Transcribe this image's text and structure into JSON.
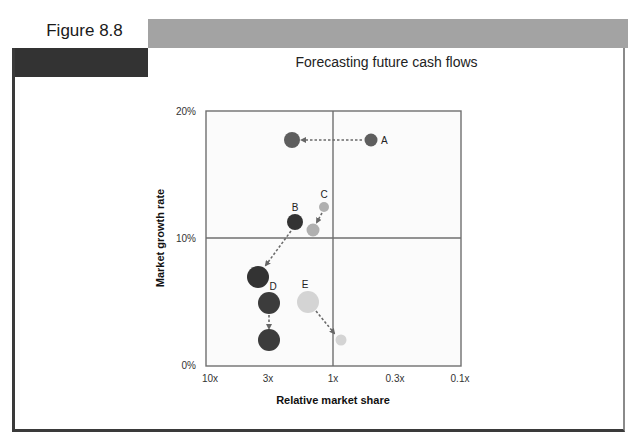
{
  "figure": {
    "label": "Figure 8.8",
    "title": "Forecasting future cash flows",
    "colors": {
      "top_bar": "#a3a3a3",
      "dark_block": "#333333",
      "frame": "#3a3a3a"
    }
  },
  "chart_data": {
    "type": "scatter",
    "subtype": "bubble (BCG growth-share matrix with movement arrows)",
    "title": "Forecasting future cash flows",
    "xlabel": "Relative market share",
    "ylabel": "Market growth rate",
    "x_ticks": [
      "10x",
      "3x",
      "1x",
      "0.3x",
      "0.1x"
    ],
    "x_scale": "log, reversed (10x on left, 0.1x on right)",
    "y_ticks": [
      "0%",
      "10%",
      "20%"
    ],
    "ylim": [
      0,
      20
    ],
    "xlim": [
      "10x",
      "0.1x"
    ],
    "quadrant_dividers": {
      "x": "1x",
      "y": "10%"
    },
    "grid": false,
    "legend": null,
    "series": [
      {
        "name": "A",
        "color": "#5e5e5e",
        "from": {
          "x": 0.5,
          "y": 17.8,
          "size": "small"
        },
        "to": {
          "x": 4.0,
          "y": 17.8,
          "size": "medium"
        }
      },
      {
        "name": "B",
        "color": "#333333",
        "from": {
          "x": 3.6,
          "y": 11.3,
          "size": "medium"
        },
        "to": {
          "x": 5.5,
          "y": 7.0,
          "size": "large"
        }
      },
      {
        "name": "C",
        "color": "#b0b0b0",
        "from": {
          "x": 1.2,
          "y": 12.5,
          "size": "small"
        },
        "to": {
          "x": 1.5,
          "y": 10.7,
          "size": "medium"
        }
      },
      {
        "name": "D",
        "color": "#3c3c3c",
        "from": {
          "x": 3.0,
          "y": 4.9,
          "size": "large"
        },
        "to": {
          "x": 3.0,
          "y": 2.1,
          "size": "large"
        }
      },
      {
        "name": "E",
        "color": "#d4d4d4",
        "from": {
          "x": 1.6,
          "y": 5.0,
          "size": "large"
        },
        "to": {
          "x": 0.85,
          "y": 2.1,
          "size": "small"
        }
      }
    ]
  },
  "plot": {
    "frame": {
      "left": 206,
      "top": 111,
      "right": 461,
      "bottom": 366
    },
    "divider_x": 333,
    "divider_y": 238,
    "bubbles": [
      {
        "id": "A-from",
        "cx": 371,
        "cy": 140,
        "r": 6.5,
        "color": "#5e5e5e"
      },
      {
        "id": "A-to",
        "cx": 292,
        "cy": 140,
        "r": 8,
        "color": "#5e5e5e"
      },
      {
        "id": "B-from",
        "cx": 295,
        "cy": 222,
        "r": 8,
        "color": "#333333"
      },
      {
        "id": "B-to",
        "cx": 258,
        "cy": 277,
        "r": 11,
        "color": "#333333"
      },
      {
        "id": "C-from",
        "cx": 324,
        "cy": 207,
        "r": 5,
        "color": "#b0b0b0"
      },
      {
        "id": "C-to",
        "cx": 313,
        "cy": 230,
        "r": 6.5,
        "color": "#b0b0b0"
      },
      {
        "id": "D-from",
        "cx": 269,
        "cy": 303,
        "r": 11,
        "color": "#3c3c3c"
      },
      {
        "id": "D-to",
        "cx": 269,
        "cy": 340,
        "r": 11,
        "color": "#3c3c3c"
      },
      {
        "id": "E-from",
        "cx": 308,
        "cy": 302,
        "r": 11,
        "color": "#d4d4d4"
      },
      {
        "id": "E-to",
        "cx": 341,
        "cy": 340,
        "r": 5.5,
        "color": "#d4d4d4"
      }
    ],
    "labels": [
      {
        "text": "A",
        "x": 381,
        "y": 144
      },
      {
        "text": "B",
        "x": 295,
        "y": 211
      },
      {
        "text": "C",
        "x": 324,
        "y": 198
      },
      {
        "text": "D",
        "x": 273,
        "y": 290
      },
      {
        "text": "E",
        "x": 305,
        "y": 288
      }
    ],
    "arrows": [
      {
        "x1": 362,
        "y1": 140,
        "x2": 302,
        "y2": 140
      },
      {
        "x1": 291,
        "y1": 231,
        "x2": 266,
        "y2": 265
      },
      {
        "x1": 322,
        "y1": 213,
        "x2": 317,
        "y2": 222
      },
      {
        "x1": 269,
        "y1": 315,
        "x2": 269,
        "y2": 328
      },
      {
        "x1": 316,
        "y1": 311,
        "x2": 334,
        "y2": 333
      }
    ]
  }
}
